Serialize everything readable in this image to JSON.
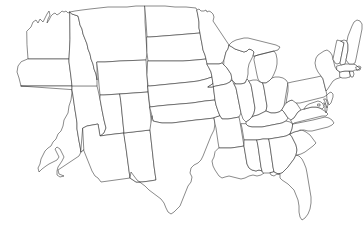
{
  "figure": {
    "kind": "map",
    "region": "Contiguous United States (lower 48)",
    "projection_look": "albers-like conic",
    "background_color": "#ffffff",
    "border_color": "#2b2b2b",
    "fill_color": "#ffffff",
    "line_width_px": 0.55,
    "labels_shown": false,
    "legend_shown": false,
    "graticule_shown": false,
    "width_px": 363,
    "height_px": 236,
    "includes_alaska": false,
    "includes_hawaii": false,
    "state_count": 49
  },
  "states": [
    {
      "code": "WA",
      "name": "Washington"
    },
    {
      "code": "OR",
      "name": "Oregon"
    },
    {
      "code": "CA",
      "name": "California"
    },
    {
      "code": "NV",
      "name": "Nevada"
    },
    {
      "code": "ID",
      "name": "Idaho"
    },
    {
      "code": "MT",
      "name": "Montana"
    },
    {
      "code": "WY",
      "name": "Wyoming"
    },
    {
      "code": "UT",
      "name": "Utah"
    },
    {
      "code": "AZ",
      "name": "Arizona"
    },
    {
      "code": "NM",
      "name": "New Mexico"
    },
    {
      "code": "CO",
      "name": "Colorado"
    },
    {
      "code": "ND",
      "name": "North Dakota"
    },
    {
      "code": "SD",
      "name": "South Dakota"
    },
    {
      "code": "NE",
      "name": "Nebraska"
    },
    {
      "code": "KS",
      "name": "Kansas"
    },
    {
      "code": "OK",
      "name": "Oklahoma"
    },
    {
      "code": "TX",
      "name": "Texas"
    },
    {
      "code": "MN",
      "name": "Minnesota"
    },
    {
      "code": "IA",
      "name": "Iowa"
    },
    {
      "code": "MO",
      "name": "Missouri"
    },
    {
      "code": "AR",
      "name": "Arkansas"
    },
    {
      "code": "LA",
      "name": "Louisiana"
    },
    {
      "code": "WI",
      "name": "Wisconsin"
    },
    {
      "code": "IL",
      "name": "Illinois"
    },
    {
      "code": "MI",
      "name": "Michigan"
    },
    {
      "code": "IN",
      "name": "Indiana"
    },
    {
      "code": "OH",
      "name": "Ohio"
    },
    {
      "code": "KY",
      "name": "Kentucky"
    },
    {
      "code": "TN",
      "name": "Tennessee"
    },
    {
      "code": "MS",
      "name": "Mississippi"
    },
    {
      "code": "AL",
      "name": "Alabama"
    },
    {
      "code": "GA",
      "name": "Georgia"
    },
    {
      "code": "FL",
      "name": "Florida"
    },
    {
      "code": "SC",
      "name": "South Carolina"
    },
    {
      "code": "NC",
      "name": "North Carolina"
    },
    {
      "code": "VA",
      "name": "Virginia"
    },
    {
      "code": "WV",
      "name": "West Virginia"
    },
    {
      "code": "MD",
      "name": "Maryland"
    },
    {
      "code": "DE",
      "name": "Delaware"
    },
    {
      "code": "PA",
      "name": "Pennsylvania"
    },
    {
      "code": "NJ",
      "name": "New Jersey"
    },
    {
      "code": "NY",
      "name": "New York"
    },
    {
      "code": "CT",
      "name": "Connecticut"
    },
    {
      "code": "RI",
      "name": "Rhode Island"
    },
    {
      "code": "MA",
      "name": "Massachusetts"
    },
    {
      "code": "VT",
      "name": "Vermont"
    },
    {
      "code": "NH",
      "name": "New Hampshire"
    },
    {
      "code": "ME",
      "name": "Maine"
    },
    {
      "code": "DC",
      "name": "District of Columbia"
    }
  ]
}
